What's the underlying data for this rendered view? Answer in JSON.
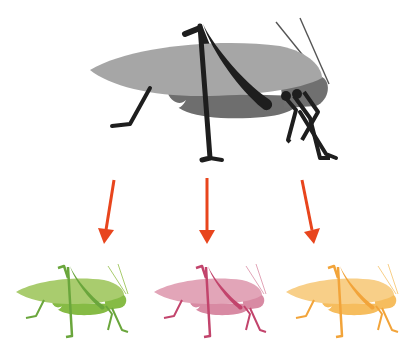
{
  "diagram": {
    "source": {
      "label": "katydid-gray",
      "colors": {
        "wing": "#a6a6a6",
        "body": "#6e6e6e",
        "legs": "#1e1e1e",
        "antenna": "#555555"
      }
    },
    "arrows": {
      "color": "#e8451d",
      "count": 3
    },
    "variants": [
      {
        "name": "green",
        "colors": {
          "wing": "#a9cc6e",
          "body": "#86bb45",
          "legs": "#6aa63c",
          "antenna": "#a9cc6e"
        }
      },
      {
        "name": "pink",
        "colors": {
          "wing": "#e2a5b8",
          "body": "#d88aa3",
          "legs": "#c2446c",
          "antenna": "#e2a5b8"
        }
      },
      {
        "name": "yellow",
        "colors": {
          "wing": "#f8cf88",
          "body": "#f6bd5e",
          "legs": "#f2a43a",
          "antenna": "#f8cf88"
        }
      }
    ]
  }
}
